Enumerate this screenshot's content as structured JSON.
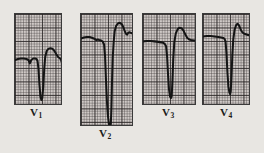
{
  "figure": {
    "name": "ecg-precordial-leads-figure",
    "background_color": "#e8e6e2",
    "paper_color": "#cfc9c6",
    "grid_color": "#282424",
    "trace_color": "#141414"
  },
  "panels": [
    {
      "id": "v1",
      "label": "V",
      "subscript": "1",
      "label_full": "V1",
      "x": 14,
      "y": 13,
      "width": 48,
      "height": 92,
      "label_x": 30,
      "label_y": 106,
      "trace_points": "0,47 3,46 6,45.5 9,45.5 12,46 14,47 15.5,50.5 17,47 19,45.5 21,45.5 22.5,46 23.5,48 24.5,56 25.5,72 26.5,84 27.5,88 28.5,86 29.5,74 30.5,56 31.5,44 33,38 35,35.5 37,35 39,35.5 41,37.5 43,41 45,44 47,45.5 48,46.5 48.5,48.5 49.5,47.5 51,46 53,45.5 55,45.5 57,46 60,46.5 64,46.5"
    },
    {
      "id": "v2",
      "label": "V",
      "subscript": "2",
      "label_full": "V2",
      "x": 80,
      "y": 13,
      "width": 53,
      "height": 113,
      "label_x": 99,
      "label_y": 127,
      "trace_points": "0,25 3,24 6,23.5 9,23.5 12,24.5 14.5,25.5 16,26.5 17.5,26 19,26.5 21,27 22.5,28 24,31 25,43 26,68 27,90 28,104 29,112 30,115 31,112 31.6,96 32.2,70 33,44 34,28 35,17.5 36.5,12 38.5,9.5 40.5,9 42.5,10.5 44,13.5 45.5,17.5 47,20.5 48,21 48.8,19.5 50,18.5 51.5,19 53.5,20 56,21 60,21.5 64,21.5"
    },
    {
      "id": "v3",
      "label": "V",
      "subscript": "3",
      "label_full": "V3",
      "x": 142,
      "y": 13,
      "width": 54,
      "height": 92,
      "label_x": 162,
      "label_y": 106,
      "trace_points": "0,28 4,27.5 8,27.5 12,28 16,28.5 19,29 21,29.5 22.5,30.5 24,33 25,43 26,62 27,77 28,84 29,86 29.8,84 30.6,68 31.4,46 32.5,29 34,20 36,15.5 38,14 40,14.5 42,17 44,21 46,24.5 48,26 50,26.5 53,27 57,27.5 62,28 66,28"
    },
    {
      "id": "v4",
      "label": "V",
      "subscript": "4",
      "label_full": "V4",
      "x": 202,
      "y": 13,
      "width": 48,
      "height": 92,
      "label_x": 220,
      "label_y": 106,
      "trace_points": "0,23 4,22.5 8,22.5 12,23 16,23.5 19,24 21,24.5 22.5,25.5 23.5,28 24.5,40 25.5,60 26.5,74 27.5,80 28.3,82 29,79 29.8,62 30.6,42 31.6,26 33,16 34.5,11.5 36,10 37.5,11.5 39,15 40.5,18 42,19.5 44,20.5 47,21.5 51,22 56,22.5 62,23 66,23"
    }
  ]
}
